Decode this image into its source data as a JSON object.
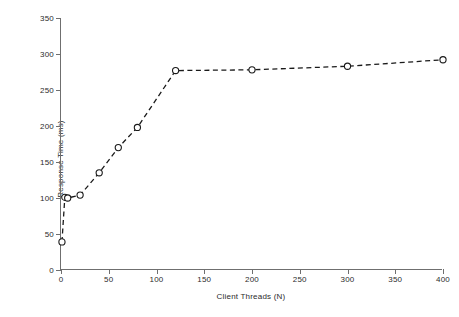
{
  "chart_data": {
    "type": "line",
    "title": "",
    "xlabel": "Client Threads (N)",
    "ylabel": "Response Time (ms)",
    "xlim": [
      0,
      400
    ],
    "ylim": [
      0,
      350
    ],
    "xticks": [
      0,
      50,
      100,
      150,
      200,
      250,
      300,
      350,
      400
    ],
    "yticks": [
      0,
      50,
      100,
      150,
      200,
      250,
      300,
      350
    ],
    "grid": false,
    "legend": null,
    "marker": "open-circle",
    "linestyle": "dashed",
    "color": "#1a1a1a",
    "series": [
      {
        "name": "Response Time",
        "x": [
          1,
          4,
          7,
          20,
          40,
          60,
          80,
          120,
          200,
          300,
          400
        ],
        "y": [
          39,
          101,
          100,
          104,
          135,
          170,
          198,
          277,
          278,
          283,
          292
        ]
      }
    ]
  },
  "axes": {
    "x_title": "Client Threads (N)",
    "y_title": "Response Time (ms)",
    "x_tick_labels": [
      "0",
      "50",
      "100",
      "150",
      "200",
      "250",
      "300",
      "350",
      "400"
    ],
    "y_tick_labels": [
      "0",
      "50",
      "100",
      "150",
      "200",
      "250",
      "300",
      "350"
    ]
  },
  "style": {
    "axis_color": "#6f6f6f",
    "series_color": "#1a1a1a",
    "text_color": "#2b2b2b",
    "background": "#ffffff"
  }
}
